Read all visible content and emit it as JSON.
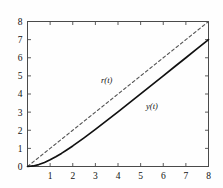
{
  "figure": {
    "background_color": "#fefefe",
    "frame_color": "#4a4a4a"
  },
  "chart_data": {
    "type": "line",
    "title": "",
    "xlabel": "",
    "ylabel": "",
    "xlim": [
      0,
      8
    ],
    "ylim": [
      0,
      8
    ],
    "grid": false,
    "legend": "inline-annotations",
    "xticks": [
      0,
      1,
      2,
      3,
      4,
      5,
      6,
      7,
      8
    ],
    "xticklabels": [
      "",
      "1",
      "2",
      "3",
      "4",
      "5",
      "6",
      "7",
      "8"
    ],
    "yticks": [
      0,
      1,
      2,
      3,
      4,
      5,
      6,
      7,
      8
    ],
    "yticklabels": [
      "0",
      "1",
      "2",
      "3",
      "4",
      "5",
      "6",
      "7",
      "8"
    ],
    "annotations": [
      {
        "text": "r(t)",
        "x": 3.5,
        "y": 4.6
      },
      {
        "text": "y(t)",
        "x": 5.5,
        "y": 3.2
      }
    ],
    "series": [
      {
        "name": "r(t)",
        "style": "dashed",
        "color": "#555555",
        "width": 1.1,
        "x": [
          0,
          1,
          2,
          3,
          4,
          5,
          6,
          7,
          8
        ],
        "values": [
          0,
          1,
          2,
          3,
          4,
          5,
          6,
          7,
          8
        ]
      },
      {
        "name": "y(t)",
        "style": "solid",
        "color": "#111111",
        "width": 1.7,
        "x": [
          0,
          0.25,
          0.5,
          0.75,
          1,
          1.25,
          1.5,
          1.75,
          2,
          2.5,
          3,
          3.5,
          4,
          4.5,
          5,
          5.5,
          6,
          6.5,
          7,
          7.5,
          8
        ],
        "values": [
          0,
          0.029,
          0.107,
          0.222,
          0.368,
          0.537,
          0.723,
          0.924,
          1.135,
          1.582,
          2.05,
          2.53,
          3.018,
          3.511,
          4.007,
          4.504,
          5.002,
          5.502,
          6.001,
          6.501,
          7.0
        ]
      }
    ]
  }
}
